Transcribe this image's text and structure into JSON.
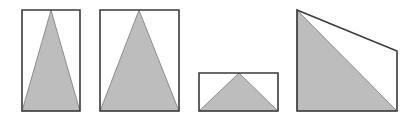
{
  "diagram": {
    "title": "",
    "stroke_color": "#3a3a3a",
    "fill_color": "#bdbdbd",
    "background": "#ffffff",
    "shapes": [
      {
        "id": "figure-1",
        "outline": "rectangle",
        "outline_points": [
          [
            22,
            10
          ],
          [
            80,
            10
          ],
          [
            80,
            111
          ],
          [
            22,
            111
          ]
        ],
        "shaded": "isosceles-triangle",
        "shaded_points": [
          [
            22,
            111
          ],
          [
            51,
            10
          ],
          [
            80,
            111
          ]
        ]
      },
      {
        "id": "figure-2",
        "outline": "rectangle",
        "outline_points": [
          [
            100,
            10
          ],
          [
            179,
            10
          ],
          [
            179,
            111
          ],
          [
            100,
            111
          ]
        ],
        "shaded": "isosceles-triangle",
        "shaded_points": [
          [
            100,
            111
          ],
          [
            139,
            10
          ],
          [
            179,
            111
          ]
        ]
      },
      {
        "id": "figure-3",
        "outline": "rectangle",
        "outline_points": [
          [
            199,
            73
          ],
          [
            278,
            73
          ],
          [
            278,
            111
          ],
          [
            199,
            111
          ]
        ],
        "shaded": "isosceles-triangle",
        "shaded_points": [
          [
            199,
            111
          ],
          [
            239,
            73
          ],
          [
            278,
            111
          ]
        ]
      },
      {
        "id": "figure-4",
        "outline": "trapezoid",
        "outline_points": [
          [
            297,
            10
          ],
          [
            397,
            51
          ],
          [
            397,
            111
          ],
          [
            297,
            111
          ]
        ],
        "shaded": "right-triangle",
        "shaded_points": [
          [
            297,
            10
          ],
          [
            297,
            111
          ],
          [
            397,
            111
          ]
        ]
      }
    ]
  }
}
